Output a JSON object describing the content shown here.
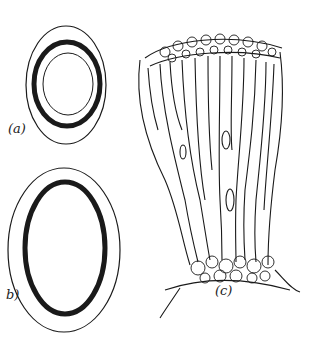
{
  "figure": {
    "panels": [
      {
        "id": "a",
        "label": "(a)",
        "description": "Cross-section, nearly circular: outer thin ring, thick dark wall, inner thin ring"
      },
      {
        "id": "b",
        "label": "b)",
        "description": "Cross-section, oval: outer thin ring and thick dark wall"
      },
      {
        "id": "c",
        "label": "(c)",
        "description": "Longitudinal section of columnar cells in a flared bundle with cellular cap at top and base"
      }
    ],
    "colors": {
      "ink": "#1a1a1a",
      "paper": "#ffffff"
    }
  }
}
